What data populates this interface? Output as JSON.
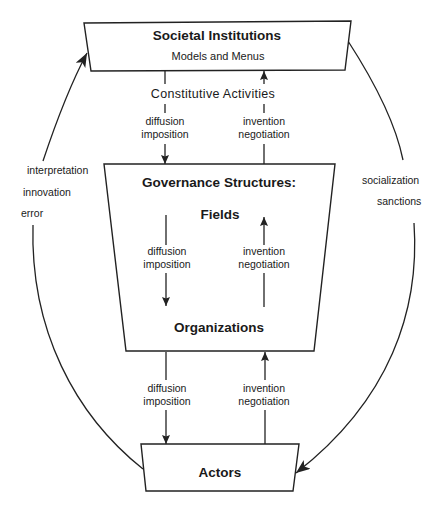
{
  "colors": {
    "background": "#ffffff",
    "line": "#222222",
    "text": "#1a1a1a"
  },
  "nodes": {
    "societal_institutions": {
      "title": "Societal Institutions",
      "subtitle": "Models and Menus"
    },
    "constitutive_activities": "Constitutive Activities",
    "governance_structures": {
      "title": "Governance Structures:",
      "upper_level": "Fields",
      "lower_level": "Organizations"
    },
    "actors": {
      "title": "Actors"
    }
  },
  "links": [
    {
      "from": "Societal Institutions",
      "to": "Governance Structures",
      "direction": "down",
      "labels": [
        "diffusion",
        "imposition"
      ]
    },
    {
      "from": "Governance Structures",
      "to": "Societal Institutions",
      "direction": "up",
      "labels": [
        "invention",
        "negotiation"
      ]
    },
    {
      "from": "Fields",
      "to": "Organizations",
      "direction": "down",
      "labels": [
        "diffusion",
        "imposition"
      ]
    },
    {
      "from": "Organizations",
      "to": "Fields",
      "direction": "up",
      "labels": [
        "invention",
        "negotiation"
      ]
    },
    {
      "from": "Governance Structures",
      "to": "Actors",
      "direction": "down",
      "labels": [
        "diffusion",
        "imposition"
      ]
    },
    {
      "from": "Actors",
      "to": "Governance Structures",
      "direction": "up",
      "labels": [
        "invention",
        "negotiation"
      ]
    }
  ],
  "outer_loops": [
    {
      "from": "Actors",
      "to": "Societal Institutions",
      "side": "left",
      "labels": [
        "interpretation",
        "innovation",
        "error"
      ]
    },
    {
      "from": "Societal Institutions",
      "to": "Actors",
      "side": "right",
      "labels": [
        "socialization",
        "sanctions"
      ]
    }
  ]
}
